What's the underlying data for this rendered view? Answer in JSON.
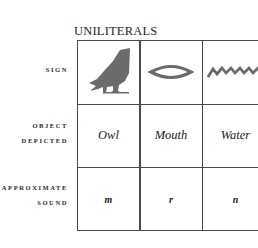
{
  "title": "UNILITERALS",
  "row_labels": {
    "sign": [
      "SIGN"
    ],
    "object": [
      "OBJECT",
      "DEPICTED"
    ],
    "sound": [
      "APPROXIMATE",
      "SOUND"
    ]
  },
  "columns": [
    {
      "sign_icon": "owl-hieroglyph-icon",
      "object": "Owl",
      "sound": "m"
    },
    {
      "sign_icon": "mouth-hieroglyph-icon",
      "object": "Mouth",
      "sound": "r"
    },
    {
      "sign_icon": "water-hieroglyph-icon",
      "object": "Water",
      "sound": "n"
    }
  ],
  "colors": {
    "glyph": "#6b6b6b",
    "grid": "#4a4a4a"
  }
}
